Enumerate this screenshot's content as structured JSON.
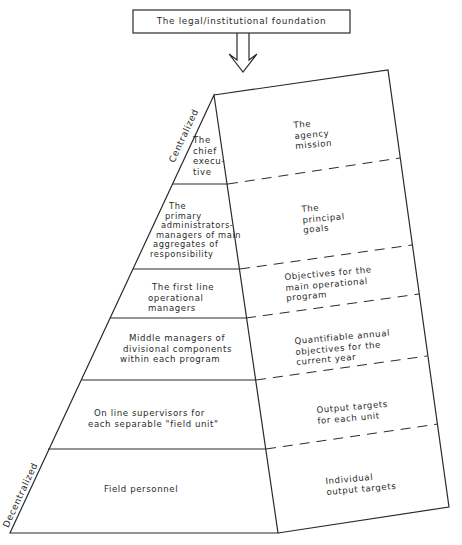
{
  "diagram": {
    "foundation_label": "The legal/institutional foundation",
    "axis": {
      "top_label": "Centralized",
      "bottom_label": "Decentralized"
    },
    "levels": [
      {
        "personnel": [
          "The",
          "chief",
          "execu-",
          "tive"
        ],
        "objective": [
          "The",
          "agency",
          "mission"
        ]
      },
      {
        "personnel": [
          "The",
          "primary",
          "administrators-",
          "managers of main",
          "aggregates of",
          "responsibility"
        ],
        "objective": [
          "The",
          "principal",
          "goals"
        ]
      },
      {
        "personnel": [
          "The first line",
          "operational",
          "managers"
        ],
        "objective": [
          "Objectives for the",
          "main operational",
          "program"
        ]
      },
      {
        "personnel": [
          "Middle managers of",
          "divisional components",
          "within each program"
        ],
        "objective": [
          "Quantifiable annual",
          "objectives for the",
          "current year"
        ]
      },
      {
        "personnel": [
          "On line supervisors for",
          "each separable \"field unit\""
        ],
        "objective": [
          "Output targets",
          "for each unit"
        ]
      },
      {
        "personnel": [
          "Field personnel"
        ],
        "objective": [
          "Individual",
          "output targets"
        ]
      }
    ],
    "colors": {
      "line": "#2a2a2a",
      "background": "#ffffff"
    }
  }
}
